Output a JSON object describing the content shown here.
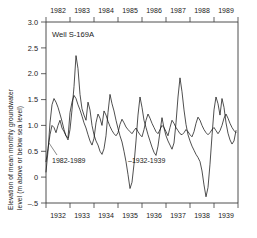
{
  "chart_data": {
    "type": "line",
    "title": "Well S-169A",
    "xlabel": "",
    "ylabel_line1": "Elevation of mean monthly groundwater",
    "ylabel_line2": "level (m above or below sea level)",
    "ylim": [
      -0.5,
      3.0
    ],
    "ytick_labels": [
      "3.0",
      "2.5",
      "2.0",
      "1.5",
      "1.0",
      "0.5",
      "0",
      "–.5"
    ],
    "ytick_values": [
      3.0,
      2.5,
      2.0,
      1.5,
      1.0,
      0.5,
      0,
      -0.5
    ],
    "grid": false,
    "legend_position": "inline-annotations",
    "top_axis": {
      "label": "1982-1989",
      "tick_labels": [
        "1982",
        "1983",
        "1984",
        "1985",
        "1986",
        "1987",
        "1988",
        "1989"
      ],
      "range": [
        1982,
        1990
      ]
    },
    "bottom_axis": {
      "label": "1932-1939",
      "tick_labels": [
        "1932",
        "1933",
        "1934",
        "1935",
        "1936",
        "1937",
        "1938",
        "1939"
      ],
      "range": [
        1932,
        1940
      ]
    },
    "annotations": [
      {
        "name": "series-label-recent",
        "text": "1982-1989"
      },
      {
        "name": "series-label-historic",
        "text": "–1932-1939"
      }
    ],
    "series": [
      {
        "name": "1982-1989",
        "x": [
          1982.0,
          1982.083,
          1982.167,
          1982.25,
          1982.333,
          1982.417,
          1982.5,
          1982.583,
          1982.667,
          1982.75,
          1982.833,
          1982.917,
          1983.0,
          1983.083,
          1983.167,
          1983.25,
          1983.333,
          1983.417,
          1983.5,
          1983.583,
          1983.667,
          1983.75,
          1983.833,
          1983.917,
          1984.0,
          1984.083,
          1984.167,
          1984.25,
          1984.333,
          1984.417,
          1984.5,
          1984.583,
          1984.667,
          1984.75,
          1984.833,
          1984.917,
          1985.0,
          1985.083,
          1985.167,
          1985.25,
          1985.333,
          1985.417,
          1985.5,
          1985.583,
          1985.667,
          1985.75,
          1985.833,
          1985.917,
          1986.0,
          1986.083,
          1986.167,
          1986.25,
          1986.333,
          1986.417,
          1986.5,
          1986.583,
          1986.667,
          1986.75,
          1986.833,
          1986.917,
          1987.0,
          1987.083,
          1987.167,
          1987.25,
          1987.333,
          1987.417,
          1987.5,
          1987.583,
          1987.667,
          1987.75,
          1987.833,
          1987.917,
          1988.0,
          1988.083,
          1988.167,
          1988.25,
          1988.333,
          1988.417,
          1988.5,
          1988.583,
          1988.667,
          1988.75,
          1988.833,
          1988.917,
          1989.0,
          1989.083,
          1989.167,
          1989.25,
          1989.333,
          1989.417,
          1989.5,
          1989.583,
          1989.667,
          1989.75,
          1989.833,
          1989.917
        ],
        "values": [
          0.3,
          0.55,
          0.82,
          1.0,
          0.96,
          0.86,
          1.0,
          1.1,
          0.95,
          0.88,
          0.8,
          0.76,
          1.25,
          1.45,
          1.58,
          1.52,
          1.4,
          1.3,
          1.18,
          1.05,
          0.95,
          0.82,
          0.7,
          0.62,
          0.75,
          1.05,
          1.22,
          1.14,
          1.0,
          1.28,
          1.2,
          1.08,
          0.98,
          0.9,
          0.84,
          0.8,
          0.86,
          1.02,
          1.12,
          1.05,
          0.97,
          0.92,
          0.88,
          0.84,
          0.9,
          0.95,
          0.88,
          0.82,
          0.78,
          0.92,
          1.1,
          1.22,
          1.14,
          1.04,
          0.96,
          0.88,
          0.84,
          0.92,
          1.0,
          0.96,
          0.88,
          0.8,
          0.96,
          1.1,
          1.04,
          0.96,
          0.9,
          0.84,
          0.82,
          0.86,
          0.92,
          0.88,
          0.82,
          0.78,
          0.88,
          1.04,
          1.16,
          1.1,
          1.0,
          0.92,
          0.86,
          0.82,
          0.86,
          0.92,
          0.96,
          0.9,
          0.84,
          0.9,
          1.0,
          1.14,
          1.22,
          1.14,
          1.04,
          0.96,
          0.9,
          0.86
        ]
      },
      {
        "name": "1932-1939",
        "x": [
          1932.0,
          1932.083,
          1932.167,
          1932.25,
          1932.333,
          1932.417,
          1932.5,
          1932.583,
          1932.667,
          1932.75,
          1932.833,
          1932.917,
          1933.0,
          1933.083,
          1933.167,
          1933.25,
          1933.333,
          1933.417,
          1933.5,
          1933.583,
          1933.667,
          1933.75,
          1933.833,
          1933.917,
          1934.0,
          1934.083,
          1934.167,
          1934.25,
          1934.333,
          1934.417,
          1934.5,
          1934.583,
          1934.667,
          1934.75,
          1934.833,
          1934.917,
          1935.0,
          1935.083,
          1935.167,
          1935.25,
          1935.333,
          1935.417,
          1935.5,
          1935.583,
          1935.667,
          1935.75,
          1935.833,
          1935.917,
          1936.0,
          1936.083,
          1936.167,
          1936.25,
          1936.333,
          1936.417,
          1936.5,
          1936.583,
          1936.667,
          1936.75,
          1936.833,
          1936.917,
          1937.0,
          1937.083,
          1937.167,
          1937.25,
          1937.333,
          1937.417,
          1937.5,
          1937.583,
          1937.667,
          1937.75,
          1937.833,
          1937.917,
          1938.0,
          1938.083,
          1938.167,
          1938.25,
          1938.333,
          1938.417,
          1938.5,
          1938.583,
          1938.667,
          1938.75,
          1938.833,
          1938.917,
          1939.0,
          1939.083,
          1939.167,
          1939.25,
          1939.333,
          1939.417,
          1939.5,
          1939.583,
          1939.667,
          1939.75,
          1939.833,
          1939.917
        ],
        "values": [
          0.1,
          0.5,
          1.05,
          1.4,
          1.52,
          1.45,
          1.35,
          1.22,
          1.08,
          0.92,
          0.8,
          0.72,
          0.92,
          1.3,
          1.75,
          2.35,
          2.1,
          1.6,
          1.32,
          1.2,
          1.1,
          1.45,
          1.3,
          1.0,
          0.82,
          0.7,
          0.62,
          0.5,
          0.44,
          0.55,
          0.8,
          1.25,
          1.6,
          1.42,
          1.28,
          1.1,
          0.94,
          0.8,
          0.68,
          0.5,
          0.3,
          0.05,
          -0.22,
          -0.1,
          0.25,
          0.7,
          1.2,
          1.55,
          1.35,
          1.1,
          0.96,
          0.82,
          0.7,
          0.58,
          0.48,
          0.42,
          0.6,
          0.88,
          1.15,
          0.95,
          0.8,
          0.7,
          0.62,
          0.54,
          0.66,
          1.05,
          1.55,
          1.92,
          1.65,
          1.3,
          1.02,
          0.82,
          0.7,
          0.6,
          0.52,
          0.44,
          0.38,
          0.3,
          0.12,
          -0.15,
          -0.38,
          -0.2,
          0.25,
          0.8,
          1.3,
          1.55,
          1.42,
          1.2,
          1.52,
          1.35,
          1.05,
          0.85,
          0.72,
          0.64,
          0.7,
          0.9
        ]
      }
    ]
  },
  "figure": {
    "well_label": "Well S-169A",
    "annotation_recent": "1982-1989",
    "annotation_historic": "–1932-1939",
    "ytick_0": "3.0",
    "ytick_1": "2.5",
    "ytick_2": "2.0",
    "ytick_3": "1.5",
    "ytick_4": "1.0",
    "ytick_5": "0.5",
    "ytick_6": "0",
    "ytick_7": "–.5",
    "top_1": "1982",
    "top_2": "1983",
    "top_3": "1984",
    "top_4": "1985",
    "top_5": "1986",
    "top_6": "1987",
    "top_7": "1988",
    "top_8": "1989",
    "bot_1": "1932",
    "bot_2": "1933",
    "bot_3": "1934",
    "bot_4": "1935",
    "bot_5": "1936",
    "bot_6": "1937",
    "bot_7": "1938",
    "bot_8": "1939",
    "ylabel_line1": "Elevation of mean monthly groundwater",
    "ylabel_line2": "level (m above or below sea level)"
  }
}
